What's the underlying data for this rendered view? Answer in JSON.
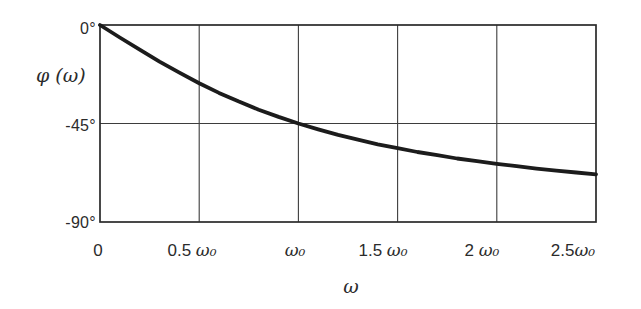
{
  "figure": {
    "bg_color": "#ffffff",
    "curve_color": "#1c1c1c",
    "grid_color": "#3d3d3d",
    "frame_color": "#2a2a2a"
  },
  "chart_data": {
    "type": "line",
    "title": "",
    "xlabel": "ω",
    "ylabel": "φ (ω)",
    "xlim": [
      0,
      2.5
    ],
    "ylim": [
      -90,
      0
    ],
    "grid": true,
    "legend": "none",
    "x_ticks": [
      0,
      0.5,
      1,
      1.5,
      2,
      2.5
    ],
    "x_tick_labels": [
      {
        "num": "0",
        "sym": ""
      },
      {
        "num": "0.5 ",
        "sym": "ω₀"
      },
      {
        "num": "",
        "sym": "ω₀"
      },
      {
        "num": "1.5 ",
        "sym": "ω₀"
      },
      {
        "num": "2 ",
        "sym": "ω₀"
      },
      {
        "num": "2.5",
        "sym": "ω₀"
      }
    ],
    "y_ticks": [
      0,
      -45,
      -90
    ],
    "y_tick_labels": [
      "0°",
      "-45°",
      "-90°"
    ],
    "series": [
      {
        "name": "phase",
        "x": [
          0,
          0.1,
          0.2,
          0.3,
          0.4,
          0.5,
          0.6,
          0.7,
          0.8,
          0.9,
          1.0,
          1.1,
          1.2,
          1.3,
          1.4,
          1.5,
          1.6,
          1.7,
          1.8,
          1.9,
          2.0,
          2.1,
          2.2,
          2.3,
          2.4,
          2.5
        ],
        "y": [
          0,
          -5.7,
          -11.3,
          -16.7,
          -21.8,
          -26.6,
          -31.0,
          -35.0,
          -38.7,
          -42.0,
          -45.0,
          -47.7,
          -50.2,
          -52.4,
          -54.5,
          -56.3,
          -58.0,
          -59.5,
          -61.0,
          -62.2,
          -63.4,
          -64.5,
          -65.6,
          -66.5,
          -67.4,
          -68.2
        ]
      }
    ]
  }
}
